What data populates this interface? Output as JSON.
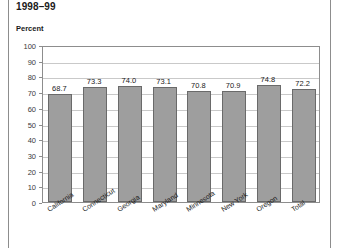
{
  "chart_data": {
    "type": "bar",
    "title": "1998–99",
    "subtitle": "",
    "ylabel": "Percent",
    "xlabel": "",
    "categories": [
      "California",
      "Connecticut",
      "Georgia",
      "Maryland",
      "Minnesota",
      "New York",
      "Oregon",
      "Total"
    ],
    "values": [
      68.7,
      73.3,
      74.0,
      73.1,
      70.8,
      70.9,
      74.8,
      72.2
    ],
    "value_labels": [
      "68.7",
      "73.3",
      "74.0",
      "73.1",
      "70.8",
      "70.9",
      "74.8",
      "72.2"
    ],
    "ylim": [
      0,
      100
    ],
    "yticks": [
      100,
      90,
      80,
      70,
      60,
      50,
      40,
      30,
      20,
      10,
      0
    ],
    "ytick_labels": [
      "100",
      "90",
      "80",
      "70",
      "60",
      "50",
      "40",
      "30",
      "20",
      "10",
      "0"
    ],
    "grid": true,
    "legend": "none",
    "bar_color": "#9e9e9e",
    "bar_edge_color": "#6a6a6a",
    "grid_color": "#c9c9c9",
    "axis_color": "#8d8d8d"
  }
}
